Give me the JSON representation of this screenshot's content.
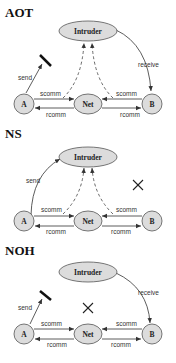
{
  "panels": [
    {
      "title": "AOT",
      "nodes": {
        "intruder": "Intruder",
        "a": "A",
        "net": "Net",
        "b": "B"
      },
      "edges": {
        "send": "send",
        "receive": "receive",
        "scomm_a": "scomm",
        "rcomm_a": "rcomm",
        "scomm_b": "scomm",
        "rcomm_b": "rcomm"
      },
      "send_blocked": true,
      "net_to_intruder_visible": true,
      "intruder_receive": true
    },
    {
      "title": "NS",
      "nodes": {
        "intruder": "Intruder",
        "a": "A",
        "net": "Net",
        "b": "B"
      },
      "edges": {
        "send": "send",
        "scomm_a": "scomm",
        "rcomm_a": "rcomm",
        "scomm_b": "scomm",
        "rcomm_b": "rcomm"
      },
      "receive_removed": true
    },
    {
      "title": "NOH",
      "nodes": {
        "intruder": "Intruder",
        "a": "A",
        "net": "Net",
        "b": "B"
      },
      "edges": {
        "send": "send",
        "receive": "receive",
        "scomm_a": "scomm",
        "rcomm_a": "rcomm",
        "scomm_b": "scomm",
        "rcomm_b": "rcomm"
      },
      "send_blocked": true,
      "net_to_intruder_removed": true
    }
  ]
}
